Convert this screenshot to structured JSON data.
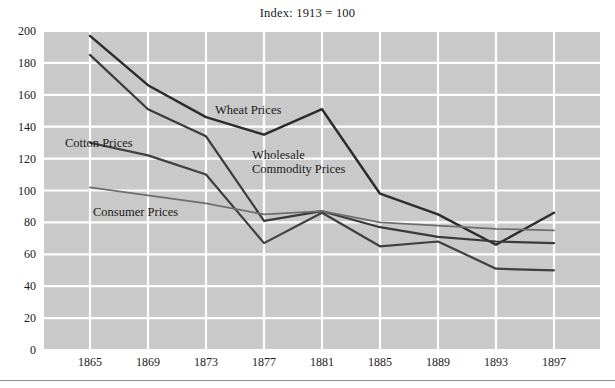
{
  "chart_data": {
    "type": "line",
    "title": "Index: 1913 = 100",
    "xlabel": "",
    "ylabel": "",
    "x": [
      1865,
      1869,
      1873,
      1877,
      1881,
      1885,
      1889,
      1893,
      1897
    ],
    "xtick_labels": [
      "1865",
      "1869",
      "1873",
      "1877",
      "1881",
      "1885",
      "1889",
      "1893",
      "1897"
    ],
    "ytick_labels": [
      "0",
      "20",
      "40",
      "60",
      "80",
      "100",
      "120",
      "140",
      "160",
      "180",
      "200"
    ],
    "yticks": [
      0,
      20,
      40,
      60,
      80,
      100,
      120,
      140,
      160,
      180,
      200
    ],
    "ylim": [
      0,
      200
    ],
    "xlim": [
      1863,
      1901
    ],
    "grid": true,
    "grid_color": "#ffffff",
    "plot_background": "#c9c9c9",
    "legend": "inline-annotations",
    "series": [
      {
        "name": "Wheat Prices",
        "color": "#2b2b2b",
        "width": 2.4,
        "values": [
          197,
          166,
          146,
          135,
          151,
          98,
          85,
          66,
          86
        ]
      },
      {
        "name": "Wholesale Commodity Prices",
        "color": "#3a3a3a",
        "width": 2.2,
        "values": [
          185,
          151,
          134,
          81,
          87,
          77,
          71,
          68,
          67
        ]
      },
      {
        "name": "Cotton Prices",
        "color": "#3f3f3f",
        "width": 2.2,
        "values": [
          130,
          122,
          110,
          67,
          86,
          65,
          68,
          51,
          50
        ]
      },
      {
        "name": "Consumer Prices",
        "color": "#6e6e6e",
        "width": 1.8,
        "values": [
          102,
          97,
          92,
          85,
          87,
          80,
          78,
          76,
          75
        ]
      }
    ],
    "annotations": [
      {
        "text": "Wheat Prices",
        "x_px": 215,
        "y_px": 103,
        "series": "Wheat Prices"
      },
      {
        "text": "Cotton Prices",
        "x_px": 65,
        "y_px": 136,
        "series": "Cotton Prices"
      },
      {
        "text": "Wholesale\nCommodity Prices",
        "x_px": 252,
        "y_px": 148,
        "series": "Wholesale Commodity Prices"
      },
      {
        "text": "Consumer Prices",
        "x_px": 93,
        "y_px": 205,
        "series": "Consumer Prices"
      }
    ]
  }
}
